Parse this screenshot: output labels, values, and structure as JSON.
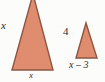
{
  "figure": {
    "background_color": "#fdfdfc",
    "fill_color": "#e08c6f",
    "stroke_color": "#8d5540",
    "text_color": "#2b2b2b"
  },
  "large_triangle": {
    "name": "large-triangle",
    "side_label": "x",
    "base_label": "x",
    "apex": [
      33,
      -6
    ],
    "bottom_left": [
      12,
      70
    ],
    "bottom_right": [
      53,
      70
    ]
  },
  "small_triangle": {
    "name": "small-triangle",
    "side_label": "4",
    "base_label": "x – 3",
    "apex": [
      86,
      23
    ],
    "bottom_left": [
      76,
      58
    ],
    "bottom_right": [
      97,
      58
    ]
  }
}
